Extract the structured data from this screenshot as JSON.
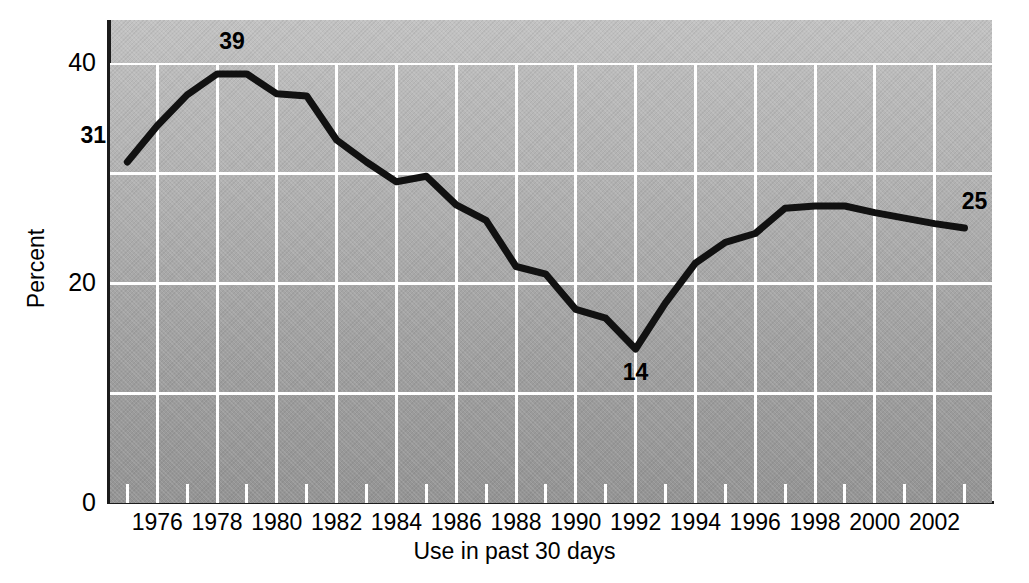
{
  "chart_data": {
    "type": "line",
    "title": "",
    "xlabel": "Use in past 30 days",
    "ylabel": "Percent",
    "xlim": [
      1974.4,
      2003.5
    ],
    "ylim": [
      0,
      44
    ],
    "ytick_values": [
      0,
      20,
      40
    ],
    "ytick_labels": [
      "0",
      "20",
      "40"
    ],
    "y_gridlines": [
      10,
      20,
      30,
      40
    ],
    "xtick_labels": [
      "1976",
      "1978",
      "1980",
      "1982",
      "1984",
      "1986",
      "1988",
      "1990",
      "1992",
      "1994",
      "1996",
      "1998",
      "2000",
      "2002"
    ],
    "xtick_values": [
      1976,
      1978,
      1980,
      1982,
      1984,
      1986,
      1988,
      1990,
      1992,
      1994,
      1996,
      1998,
      2000,
      2002
    ],
    "x_minor_ticks": [
      1975,
      1977,
      1979,
      1981,
      1983,
      1985,
      1987,
      1989,
      1991,
      1993,
      1995,
      1997,
      1999,
      2001,
      2003
    ],
    "grid": true,
    "legend": "none",
    "x": [
      1975,
      1976,
      1977,
      1978,
      1979,
      1980,
      1981,
      1982,
      1983,
      1984,
      1985,
      1986,
      1987,
      1988,
      1989,
      1990,
      1991,
      1992,
      1993,
      1994,
      1995,
      1996,
      1997,
      1998,
      1999,
      2000,
      2001,
      2002,
      2003
    ],
    "values": [
      31,
      34.3,
      37.1,
      39,
      39,
      37.2,
      37,
      33,
      31,
      29.2,
      29.7,
      27.1,
      25.7,
      21.5,
      20.8,
      17.6,
      16.8,
      14,
      18.2,
      21.8,
      23.7,
      24.5,
      26.8,
      27,
      27,
      26.4,
      25.9,
      25.4,
      25
    ],
    "annotations": [
      {
        "label": "31",
        "x": 1975,
        "y": 31
      },
      {
        "label": "39",
        "x": 1978.5,
        "y": 39
      },
      {
        "label": "14",
        "x": 1992,
        "y": 14
      },
      {
        "label": "25",
        "x": 2003,
        "y": 25
      }
    ],
    "line_color": "#111111",
    "grid_color": "#ffffff",
    "plot_background": "#ababab",
    "figure_background": "#ffffff"
  }
}
